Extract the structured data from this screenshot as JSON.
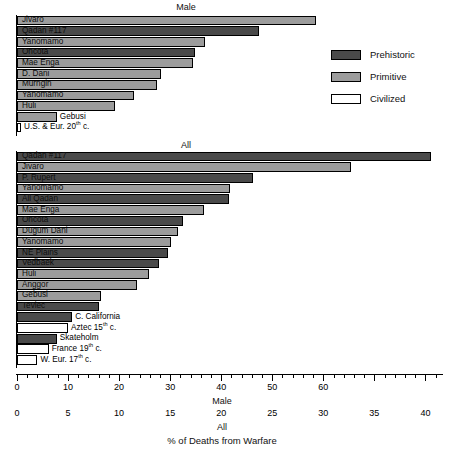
{
  "figure": {
    "caption": "% of Deaths from Warfare",
    "panels": [
      {
        "key": "male",
        "title": "Male"
      },
      {
        "key": "all",
        "title": "All"
      }
    ]
  },
  "legend": {
    "position": "upper-right",
    "items": [
      {
        "label": "Prehistoric",
        "color": "#4a4a4a",
        "key": "prehistoric"
      },
      {
        "label": "Primitive",
        "color": "#9c9c9c",
        "key": "primitive"
      },
      {
        "label": "Civilized",
        "color": "#ffffff",
        "key": "civilized"
      }
    ]
  },
  "axes": {
    "male": {
      "name": "Male",
      "ticks": [
        0,
        10,
        20,
        30,
        40,
        50,
        60
      ],
      "minor_step": 2,
      "range": [
        0,
        83.5
      ]
    },
    "all": {
      "name": "All",
      "ticks": [
        0,
        5,
        10,
        15,
        20,
        25,
        30,
        35,
        40
      ],
      "range": [
        0,
        41.8
      ]
    }
  },
  "chart_data": {
    "type": "bar",
    "orientation": "horizontal",
    "title": "% of Deaths from Warfare",
    "xlabel": "% of Deaths from Warfare",
    "ylabel": "",
    "grid": false,
    "legend": [
      "Prehistoric",
      "Primitive",
      "Civilized"
    ],
    "legend_position": "upper-right",
    "panels": [
      {
        "name": "Male",
        "xlabel": "Male",
        "xlim": [
          0,
          83.5
        ],
        "xticks": [
          0,
          10,
          20,
          30,
          40,
          50,
          60
        ],
        "categories": [
          "Jivaro",
          "Qadan #117",
          "Yanomamo",
          "Oncota",
          "Mae Enga",
          "D. Dani",
          "Murngin",
          "Yanomamo",
          "Huli",
          "Gebusi",
          "U.S. & Eur. 20th c."
        ],
        "values": [
          58.5,
          47.4,
          36.8,
          34.8,
          34.5,
          28.3,
          27.5,
          23.0,
          19.2,
          7.8,
          0.8
        ],
        "groups": [
          "primitive",
          "prehistoric",
          "primitive",
          "prehistoric",
          "primitive",
          "primitive",
          "primitive",
          "primitive",
          "primitive",
          "primitive",
          "civilized"
        ],
        "label_placement": [
          "inside",
          "inside",
          "inside",
          "inside",
          "inside",
          "inside",
          "inside",
          "inside",
          "inside",
          "outside",
          "outside"
        ]
      },
      {
        "name": "All",
        "xlabel": "All",
        "xlim": [
          0,
          41.8
        ],
        "xticks": [
          0,
          5,
          10,
          15,
          20,
          25,
          30,
          35,
          40
        ],
        "categories": [
          "Qadan #117",
          "Jivaro",
          "P. Rupert",
          "Yanomamo",
          "All Qadan",
          "Mae Enga",
          "Oncota",
          "Dugum Dani",
          "Yanomamo",
          "NE Plains",
          "Vedbaek",
          "Huli",
          "Anggor",
          "Gebusi",
          "Teviec",
          "C. California",
          "Aztec 15th c.",
          "Skateholm",
          "France 19th c.",
          "W. Eur. 17th c."
        ],
        "values": [
          40.5,
          32.7,
          23.1,
          20.9,
          20.8,
          18.3,
          16.3,
          15.8,
          15.1,
          14.8,
          13.9,
          12.9,
          11.8,
          8.2,
          8.0,
          5.4,
          5.0,
          3.9,
          3.1,
          2.0
        ],
        "groups": [
          "prehistoric",
          "primitive",
          "prehistoric",
          "primitive",
          "prehistoric",
          "primitive",
          "prehistoric",
          "primitive",
          "primitive",
          "prehistoric",
          "prehistoric",
          "primitive",
          "primitive",
          "primitive",
          "prehistoric",
          "prehistoric",
          "civilized",
          "prehistoric",
          "civilized",
          "civilized"
        ],
        "label_placement": [
          "inside",
          "inside",
          "inside",
          "inside",
          "inside",
          "inside",
          "inside",
          "inside",
          "inside",
          "inside",
          "inside",
          "inside",
          "inside",
          "inside",
          "inside",
          "outside",
          "outside",
          "outside",
          "outside",
          "outside"
        ]
      }
    ]
  }
}
